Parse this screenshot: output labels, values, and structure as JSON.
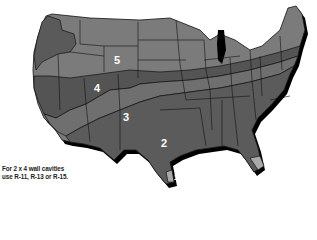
{
  "map": {
    "title": "Insulation zone map (R-value zones)",
    "zones": [
      {
        "id": "1",
        "label": "1",
        "color": "#a9a9a9"
      },
      {
        "id": "2",
        "label": "2",
        "color": "#5b5b5b"
      },
      {
        "id": "3",
        "label": "3",
        "color": "#6f6f6f"
      },
      {
        "id": "4",
        "label": "4",
        "color": "#545454"
      },
      {
        "id": "5",
        "label": "5",
        "color": "#7b7b7b"
      }
    ],
    "shadow_color": "#000000",
    "border_color": "#111111"
  },
  "note": {
    "line1": "For 2 x 4 wall cavities",
    "line2": "use R-11, R-13 or R-15."
  }
}
